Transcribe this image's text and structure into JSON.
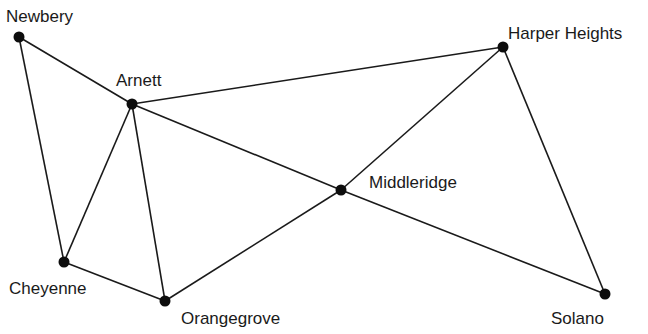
{
  "diagram": {
    "type": "graph",
    "nodes": [
      {
        "id": "newbery",
        "label": "Newbery",
        "x": 19,
        "y": 37,
        "lx": 6,
        "ly": 22
      },
      {
        "id": "arnett",
        "label": "Arnett",
        "x": 132,
        "y": 104,
        "lx": 116,
        "ly": 86
      },
      {
        "id": "harper",
        "label": "Harper Heights",
        "x": 503,
        "y": 47,
        "lx": 508,
        "ly": 39
      },
      {
        "id": "middleridge",
        "label": "Middleridge",
        "x": 341,
        "y": 190,
        "lx": 369,
        "ly": 188
      },
      {
        "id": "cheyenne",
        "label": "Cheyenne",
        "x": 64,
        "y": 262,
        "lx": 9,
        "ly": 294
      },
      {
        "id": "orangegrove",
        "label": "Orangegrove",
        "x": 165,
        "y": 301,
        "lx": 181,
        "ly": 324
      },
      {
        "id": "solano",
        "label": "Solano",
        "x": 605,
        "y": 294,
        "lx": 551,
        "ly": 324
      }
    ],
    "edges": [
      [
        "newbery",
        "arnett"
      ],
      [
        "newbery",
        "cheyenne"
      ],
      [
        "arnett",
        "harper"
      ],
      [
        "arnett",
        "middleridge"
      ],
      [
        "arnett",
        "cheyenne"
      ],
      [
        "arnett",
        "orangegrove"
      ],
      [
        "middleridge",
        "harper"
      ],
      [
        "middleridge",
        "solano"
      ],
      [
        "middleridge",
        "orangegrove"
      ],
      [
        "harper",
        "solano"
      ],
      [
        "cheyenne",
        "orangegrove"
      ]
    ]
  }
}
